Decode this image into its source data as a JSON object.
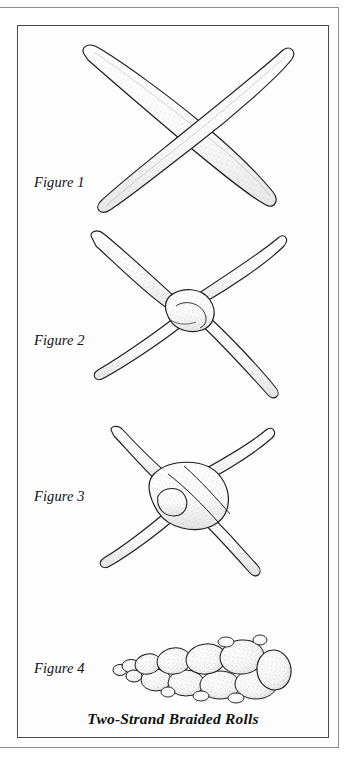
{
  "document": {
    "kind": "illustrated-instruction-plate",
    "caption": "Two-Strand Braided Rolls",
    "background_color": "#fdfdfd",
    "ink_color": "#1a1a1a",
    "frame_color": "#4a4a4a",
    "shading_style": "stipple"
  },
  "figures": [
    {
      "label": "Figure 1",
      "description": "Two tapered dough ropes laid across each other in an X shape"
    },
    {
      "label": "Figure 2",
      "description": "The two ropes given a single twist at the center forming a loose knot"
    },
    {
      "label": "Figure 3",
      "description": "The twist pulled tighter, forming a compact knot at the crossing"
    },
    {
      "label": "Figure 4",
      "description": "The finished two-strand braided roll, tapered at one end"
    }
  ]
}
